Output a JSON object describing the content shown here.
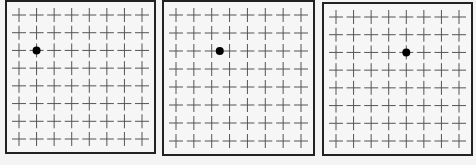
{
  "diagram": {
    "grid": {
      "rows": 8,
      "cols": 8,
      "marker": "plus-cross",
      "marker_color": "#555555"
    },
    "dot_color": "#000000",
    "panels": [
      {
        "id": 1,
        "left": 5,
        "top": 0,
        "width": 151,
        "height": 154,
        "dot": {
          "row": 2,
          "col": 1
        }
      },
      {
        "id": 2,
        "left": 162,
        "top": 0,
        "width": 153,
        "height": 156,
        "dot": {
          "row": 2,
          "col": 2.45
        }
      },
      {
        "id": 3,
        "left": 322,
        "top": 2,
        "width": 151,
        "height": 154,
        "dot": {
          "row": 2,
          "col": 4
        }
      }
    ]
  }
}
